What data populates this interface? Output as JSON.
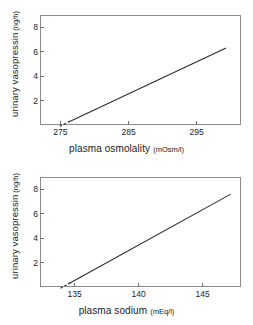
{
  "figure": {
    "background_color": "#ffffff",
    "line_color": "#2b2b2b",
    "frame_color": "#8c8c8c"
  },
  "chart_data": [
    {
      "type": "line",
      "title": "",
      "xlabel": "plasma osmolality",
      "xunit": "(mOsm/l)",
      "ylabel": "urinary vasopressin",
      "yunit": "(ng/h)",
      "xlim": [
        272.0,
        301.5
      ],
      "ylim": [
        0.0,
        9.0
      ],
      "xticks": [
        275,
        285,
        295
      ],
      "xticklabels": [
        "275",
        "285",
        "295"
      ],
      "yticks": [
        2,
        4,
        6,
        8
      ],
      "yticklabels": [
        "2",
        "4",
        "6",
        "8"
      ],
      "grid": false,
      "legend": null,
      "series": [
        {
          "name": "regression line",
          "style": "solid",
          "x": [
            276.2,
            299.3
          ],
          "y": [
            0.25,
            6.3
          ]
        },
        {
          "name": "extrapolated segment",
          "style": "dashed",
          "x": [
            274.9,
            276.4
          ],
          "y": [
            -0.1,
            0.3
          ]
        }
      ]
    },
    {
      "type": "line",
      "title": "",
      "xlabel": "plasma sodium",
      "xunit": "(mEq/l)",
      "ylabel": "urinary vasopressin",
      "yunit": "(ng/h)",
      "xlim": [
        132.3,
        148.0
      ],
      "ylim": [
        0.0,
        9.0
      ],
      "xticks": [
        135,
        140,
        145
      ],
      "xticklabels": [
        "135",
        "140",
        "145"
      ],
      "yticks": [
        2,
        4,
        6,
        8
      ],
      "yticklabels": [
        "2",
        "4",
        "6",
        "8"
      ],
      "grid": false,
      "legend": null,
      "series": [
        {
          "name": "regression line",
          "style": "solid",
          "x": [
            134.5,
            147.2
          ],
          "y": [
            0.25,
            7.6
          ]
        },
        {
          "name": "extrapolated segment",
          "style": "dashed",
          "x": [
            133.9,
            134.7
          ],
          "y": [
            -0.1,
            0.35
          ]
        }
      ]
    }
  ]
}
